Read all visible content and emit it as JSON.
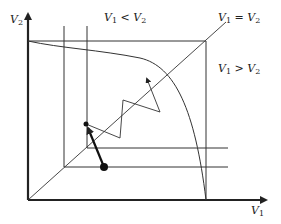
{
  "diagram": {
    "axes": {
      "y_label": "V",
      "y_label_sub": "2",
      "x_label": "V",
      "x_label_sub": "1"
    },
    "regions": {
      "upper_left": {
        "a": "V",
        "a_sub": "1",
        "op": " < ",
        "b": "V",
        "b_sub": "2"
      },
      "diagonal": {
        "a": "V",
        "a_sub": "1",
        "op": " = ",
        "b": "V",
        "b_sub": "2"
      },
      "lower_right": {
        "a": "V",
        "a_sub": "1",
        "op": " > ",
        "b": "V",
        "b_sub": "2"
      }
    },
    "colors": {
      "line": "#222222",
      "background": "#ffffff"
    },
    "geometry": {
      "origin": [
        28,
        200
      ],
      "box_top_right": [
        206,
        41
      ],
      "diagonal_end": [
        226,
        22
      ],
      "vertical_lines_x": [
        64,
        87
      ],
      "horizontal_lines_y": [
        148,
        167
      ],
      "start_point": [
        104,
        167
      ],
      "end_point": [
        86,
        124
      ],
      "zigzag_path": [
        [
          86,
          124
        ],
        [
          120,
          138
        ],
        [
          123,
          100
        ],
        [
          160,
          112
        ],
        [
          146,
          78
        ]
      ]
    }
  }
}
